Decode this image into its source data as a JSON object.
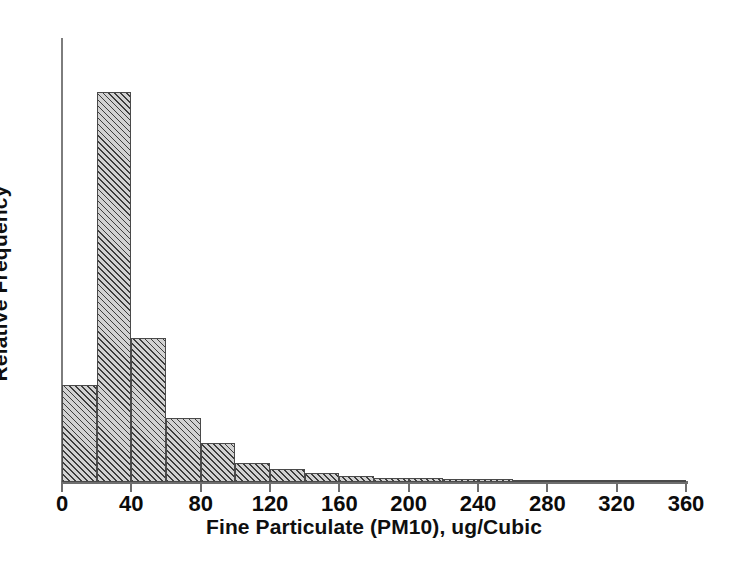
{
  "chart_data": {
    "type": "bar",
    "title": "",
    "subtitle": "",
    "xlabel": "Fine Particulate (PM10), ug/Cubic",
    "ylabel": "Relative Frequency",
    "grid": false,
    "legend": false,
    "legend_position": "none",
    "histogram": true,
    "bin_width": 20,
    "xlim": [
      0,
      360
    ],
    "ylim": [
      0,
      1.0
    ],
    "xticks": [
      0,
      40,
      80,
      120,
      160,
      200,
      240,
      280,
      320,
      360
    ],
    "xtick_labels": [
      "0",
      "40",
      "80",
      "120",
      "160",
      "200",
      "240",
      "280",
      "320",
      "360"
    ],
    "yticks": [],
    "ytick_labels": [],
    "bin_edges": [
      0,
      20,
      40,
      60,
      80,
      100,
      120,
      140,
      160,
      180,
      200,
      220,
      240,
      260,
      280,
      300,
      320,
      340,
      360
    ],
    "categories": [
      "0-20",
      "20-40",
      "40-60",
      "60-80",
      "80-100",
      "100-120",
      "120-140",
      "140-160",
      "160-180",
      "180-200",
      "200-220",
      "220-240",
      "240-260",
      "260-280",
      "280-300",
      "300-320",
      "320-340",
      "340-360"
    ],
    "values": [
      0.249,
      1.0,
      0.369,
      0.164,
      0.1,
      0.049,
      0.033,
      0.023,
      0.015,
      0.009,
      0.009,
      0.008,
      0.008,
      0.0,
      0.0,
      0.0,
      0.0,
      0.0
    ],
    "series": [
      {
        "name": "Relative Frequency",
        "values": [
          0.249,
          1.0,
          0.369,
          0.164,
          0.1,
          0.049,
          0.033,
          0.023,
          0.015,
          0.009,
          0.009,
          0.008,
          0.008,
          0.0,
          0.0,
          0.0,
          0.0,
          0.0
        ]
      }
    ],
    "colors": {
      "bar_fill": "#d2d2d2",
      "bar_hatch": "#3d3d3d",
      "bar_edge": "#4a4a4a",
      "axis": "#6e6e6e",
      "text": "#0b0b0b",
      "background": "#ffffff"
    }
  }
}
